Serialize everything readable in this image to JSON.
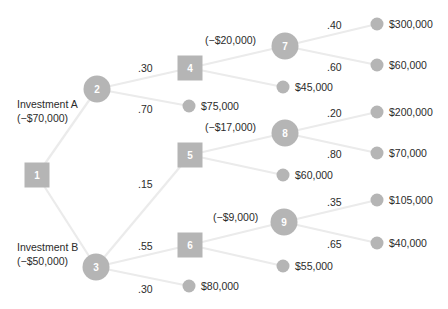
{
  "diagram": {
    "type": "decision-tree",
    "colors": {
      "node": "#b5b5b5",
      "edge": "#ebebeb",
      "text": "#2b2b2b",
      "node_text": "#ffffff"
    },
    "nodes": [
      {
        "id": "1",
        "kind": "decision",
        "x": 37,
        "y": 175
      },
      {
        "id": "2",
        "kind": "chance",
        "x": 97,
        "y": 89
      },
      {
        "id": "3",
        "kind": "chance",
        "x": 96,
        "y": 267
      },
      {
        "id": "4",
        "kind": "decision",
        "x": 190,
        "y": 68
      },
      {
        "id": "5",
        "kind": "decision",
        "x": 190,
        "y": 155
      },
      {
        "id": "6",
        "kind": "decision",
        "x": 190,
        "y": 245
      },
      {
        "id": "7",
        "kind": "chance",
        "x": 285,
        "y": 46
      },
      {
        "id": "8",
        "kind": "chance",
        "x": 285,
        "y": 133
      },
      {
        "id": "9",
        "kind": "chance",
        "x": 284,
        "y": 222
      }
    ],
    "terminals": [
      {
        "id": "t75",
        "x": 189,
        "y": 106,
        "label": "$75,000"
      },
      {
        "id": "t45",
        "x": 283,
        "y": 87,
        "label": "$45,000"
      },
      {
        "id": "t300",
        "x": 377,
        "y": 24,
        "label": "$300,000"
      },
      {
        "id": "t60a",
        "x": 377,
        "y": 65,
        "label": "$60,000"
      },
      {
        "id": "t200",
        "x": 377,
        "y": 112,
        "label": "$200,000"
      },
      {
        "id": "t70",
        "x": 377,
        "y": 153,
        "label": "$70,000"
      },
      {
        "id": "t60b",
        "x": 283,
        "y": 175,
        "label": "$60,000"
      },
      {
        "id": "t105",
        "x": 377,
        "y": 200,
        "label": "$105,000"
      },
      {
        "id": "t40",
        "x": 377,
        "y": 243,
        "label": "$40,000"
      },
      {
        "id": "t55",
        "x": 283,
        "y": 266,
        "label": "$55,000"
      },
      {
        "id": "t80",
        "x": 189,
        "y": 286,
        "label": "$80,000"
      }
    ],
    "edges": [
      [
        "1",
        "2"
      ],
      [
        "1",
        "3"
      ],
      [
        "2",
        "4"
      ],
      [
        "2",
        "t75"
      ],
      [
        "3",
        "5"
      ],
      [
        "3",
        "6"
      ],
      [
        "3",
        "t80"
      ],
      [
        "4",
        "7"
      ],
      [
        "4",
        "t45"
      ],
      [
        "5",
        "8"
      ],
      [
        "5",
        "t60b"
      ],
      [
        "6",
        "9"
      ],
      [
        "6",
        "t55"
      ],
      [
        "7",
        "t300"
      ],
      [
        "7",
        "t60a"
      ],
      [
        "8",
        "t200"
      ],
      [
        "8",
        "t70"
      ],
      [
        "9",
        "t105"
      ],
      [
        "9",
        "t40"
      ]
    ],
    "texts": {
      "investment_a": "Investment A",
      "investment_a_cost": "(−$70,000)",
      "investment_b": "Investment B",
      "investment_b_cost": "(−$50,000)",
      "cost_4": "(−$20,000)",
      "cost_5": "(−$17,000)",
      "cost_6": "(−$9,000)",
      "p_2_4": ".30",
      "p_2_75": ".70",
      "p_3_5": ".15",
      "p_3_6": ".55",
      "p_3_80": ".30",
      "p_7_300": ".40",
      "p_7_60": ".60",
      "p_8_200": ".20",
      "p_8_70": ".80",
      "p_9_105": ".35",
      "p_9_40": ".65"
    }
  }
}
